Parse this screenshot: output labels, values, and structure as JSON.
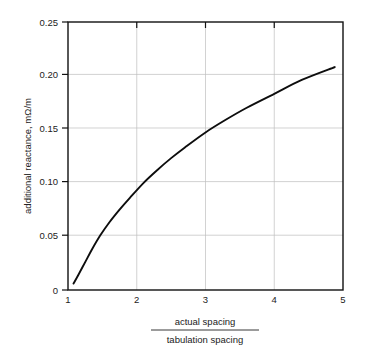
{
  "chart_data": {
    "type": "line",
    "title": "",
    "subtitle": "",
    "xlabel_numerator": "actual spacing",
    "xlabel_denominator": "tabulation spacing",
    "ylabel": "additional reactance, mΩ/m",
    "xlim": [
      1,
      5
    ],
    "ylim": [
      0,
      0.25
    ],
    "grid": true,
    "legend": "none",
    "xticks": [
      1,
      2,
      3,
      4,
      5
    ],
    "xtick_labels": [
      "1",
      "2",
      "3",
      "4",
      "5"
    ],
    "yticks": [
      0,
      0.05,
      0.1,
      0.15,
      0.2,
      0.25
    ],
    "ytick_labels": [
      "0",
      "0.05",
      "0.10",
      "0.15",
      "0.20",
      "0.25"
    ],
    "series": [
      {
        "name": "additional reactance",
        "color": "#0d0d0d",
        "x": [
          1.08,
          1.15,
          1.25,
          1.35,
          1.47,
          1.6,
          1.75,
          1.9,
          2.1,
          2.3,
          2.5,
          2.7,
          3.0,
          3.3,
          3.6,
          4.0,
          4.4,
          4.88
        ],
        "y": [
          0.006,
          0.014,
          0.026,
          0.038,
          0.051,
          0.063,
          0.075,
          0.086,
          0.1,
          0.112,
          0.123,
          0.133,
          0.147,
          0.159,
          0.17,
          0.183,
          0.196,
          0.208
        ]
      }
    ],
    "annotations": []
  },
  "axis": {
    "y_label": "additional reactance, mΩ/m",
    "x_label_top": "actual spacing",
    "x_label_bottom": "tabulation spacing"
  },
  "ticks": {
    "y": [
      "0.25",
      "0.20",
      "0.15",
      "0.10",
      "0.05",
      "0"
    ],
    "x": [
      "1",
      "2",
      "3",
      "4",
      "5"
    ]
  },
  "colors": {
    "background": "#ffffff",
    "curve": "#0d0d0d",
    "grid": "#bfbfbf",
    "frame": "#111111",
    "text": "#222222"
  }
}
